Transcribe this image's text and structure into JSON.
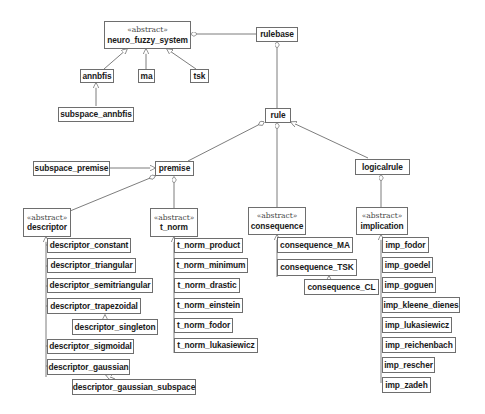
{
  "diagram": {
    "type": "uml-class-diagram",
    "stereotype_label": "«abstract»",
    "classes": [
      {
        "id": "neuro_fuzzy_system",
        "name": "neuro_fuzzy_system",
        "stereotype": "«abstract»"
      },
      {
        "id": "rulebase",
        "name": "rulebase"
      },
      {
        "id": "annbfis",
        "name": "annbfis"
      },
      {
        "id": "ma",
        "name": "ma"
      },
      {
        "id": "tsk",
        "name": "tsk"
      },
      {
        "id": "subspace_annbfis",
        "name": "subspace_annbfis"
      },
      {
        "id": "rule",
        "name": "rule"
      },
      {
        "id": "subspace_premise",
        "name": "subspace_premise"
      },
      {
        "id": "premise",
        "name": "premise"
      },
      {
        "id": "logicalrule",
        "name": "logicalrule"
      },
      {
        "id": "descriptor",
        "name": "descriptor",
        "stereotype": "«abstract»"
      },
      {
        "id": "t_norm",
        "name": "t_norm",
        "stereotype": "«abstract»"
      },
      {
        "id": "consequence",
        "name": "consequence",
        "stereotype": "«abstract»"
      },
      {
        "id": "implication",
        "name": "implication",
        "stereotype": "«abstract»"
      },
      {
        "id": "descriptor_constant",
        "name": "descriptor_constant"
      },
      {
        "id": "descriptor_triangular",
        "name": "descriptor_triangular"
      },
      {
        "id": "descriptor_semitriangular",
        "name": "descriptor_semitriangular"
      },
      {
        "id": "descriptor_trapezoidal",
        "name": "descriptor_trapezoidal"
      },
      {
        "id": "descriptor_singleton",
        "name": "descriptor_singleton"
      },
      {
        "id": "descriptor_sigmoidal",
        "name": "descriptor_sigmoidal"
      },
      {
        "id": "descriptor_gaussian",
        "name": "descriptor_gaussian"
      },
      {
        "id": "descriptor_gaussian_subspace",
        "name": "descriptor_gaussian_subspace"
      },
      {
        "id": "t_norm_product",
        "name": "t_norm_product"
      },
      {
        "id": "t_norm_minimum",
        "name": "t_norm_minimum"
      },
      {
        "id": "t_norm_drastic",
        "name": "t_norm_drastic"
      },
      {
        "id": "t_norm_einstein",
        "name": "t_norm_einstein"
      },
      {
        "id": "t_norm_fodor",
        "name": "t_norm_fodor"
      },
      {
        "id": "t_norm_lukasiewicz",
        "name": "t_norm_lukasiewicz"
      },
      {
        "id": "consequence_MA",
        "name": "consequence_MA"
      },
      {
        "id": "consequence_TSK",
        "name": "consequence_TSK"
      },
      {
        "id": "consequence_CL",
        "name": "consequence_CL"
      },
      {
        "id": "imp_fodor",
        "name": "imp_fodor"
      },
      {
        "id": "imp_goedel",
        "name": "imp_goedel"
      },
      {
        "id": "imp_goguen",
        "name": "imp_goguen"
      },
      {
        "id": "imp_kleene_dienes",
        "name": "imp_kleene_dienes"
      },
      {
        "id": "imp_lukasiewicz",
        "name": "imp_lukasiewicz"
      },
      {
        "id": "imp_reichenbach",
        "name": "imp_reichenbach"
      },
      {
        "id": "imp_rescher",
        "name": "imp_rescher"
      },
      {
        "id": "imp_zadeh",
        "name": "imp_zadeh"
      }
    ],
    "relations": [
      {
        "type": "aggregation",
        "whole": "neuro_fuzzy_system",
        "part": "rulebase"
      },
      {
        "type": "aggregation",
        "whole": "rulebase",
        "part": "rule"
      },
      {
        "type": "aggregation",
        "whole": "rule",
        "part": "premise"
      },
      {
        "type": "aggregation",
        "whole": "rule",
        "part": "consequence"
      },
      {
        "type": "generalization",
        "child": "logicalrule",
        "parent": "rule"
      },
      {
        "type": "aggregation",
        "whole": "logicalrule",
        "part": "implication"
      },
      {
        "type": "generalization",
        "child": "annbfis",
        "parent": "neuro_fuzzy_system"
      },
      {
        "type": "generalization",
        "child": "ma",
        "parent": "neuro_fuzzy_system"
      },
      {
        "type": "generalization",
        "child": "tsk",
        "parent": "neuro_fuzzy_system"
      },
      {
        "type": "generalization",
        "child": "subspace_annbfis",
        "parent": "annbfis"
      },
      {
        "type": "generalization",
        "child": "subspace_premise",
        "parent": "premise"
      },
      {
        "type": "aggregation",
        "whole": "premise",
        "part": "descriptor"
      },
      {
        "type": "aggregation",
        "whole": "premise",
        "part": "t_norm"
      },
      {
        "type": "generalization",
        "child": "descriptor_constant",
        "parent": "descriptor"
      },
      {
        "type": "generalization",
        "child": "descriptor_triangular",
        "parent": "descriptor"
      },
      {
        "type": "generalization",
        "child": "descriptor_semitriangular",
        "parent": "descriptor"
      },
      {
        "type": "generalization",
        "child": "descriptor_trapezoidal",
        "parent": "descriptor"
      },
      {
        "type": "generalization",
        "child": "descriptor_singleton",
        "parent": "descriptor_trapezoidal"
      },
      {
        "type": "generalization",
        "child": "descriptor_sigmoidal",
        "parent": "descriptor"
      },
      {
        "type": "generalization",
        "child": "descriptor_gaussian",
        "parent": "descriptor"
      },
      {
        "type": "generalization",
        "child": "descriptor_gaussian_subspace",
        "parent": "descriptor_gaussian"
      },
      {
        "type": "generalization",
        "child": "t_norm_product",
        "parent": "t_norm"
      },
      {
        "type": "generalization",
        "child": "t_norm_minimum",
        "parent": "t_norm"
      },
      {
        "type": "generalization",
        "child": "t_norm_drastic",
        "parent": "t_norm"
      },
      {
        "type": "generalization",
        "child": "t_norm_einstein",
        "parent": "t_norm"
      },
      {
        "type": "generalization",
        "child": "t_norm_fodor",
        "parent": "t_norm"
      },
      {
        "type": "generalization",
        "child": "t_norm_lukasiewicz",
        "parent": "t_norm"
      },
      {
        "type": "generalization",
        "child": "consequence_MA",
        "parent": "consequence"
      },
      {
        "type": "generalization",
        "child": "consequence_TSK",
        "parent": "consequence"
      },
      {
        "type": "generalization",
        "child": "consequence_CL",
        "parent": "consequence_TSK"
      },
      {
        "type": "generalization",
        "child": "imp_fodor",
        "parent": "implication"
      },
      {
        "type": "generalization",
        "child": "imp_goedel",
        "parent": "implication"
      },
      {
        "type": "generalization",
        "child": "imp_goguen",
        "parent": "implication"
      },
      {
        "type": "generalization",
        "child": "imp_kleene_dienes",
        "parent": "implication"
      },
      {
        "type": "generalization",
        "child": "imp_lukasiewicz",
        "parent": "implication"
      },
      {
        "type": "generalization",
        "child": "imp_reichenbach",
        "parent": "implication"
      },
      {
        "type": "generalization",
        "child": "imp_rescher",
        "parent": "implication"
      },
      {
        "type": "generalization",
        "child": "imp_zadeh",
        "parent": "implication"
      }
    ]
  },
  "colors": {
    "line": "#6e6e6e",
    "text": "#1a1a1a",
    "background": "#ffffff"
  }
}
